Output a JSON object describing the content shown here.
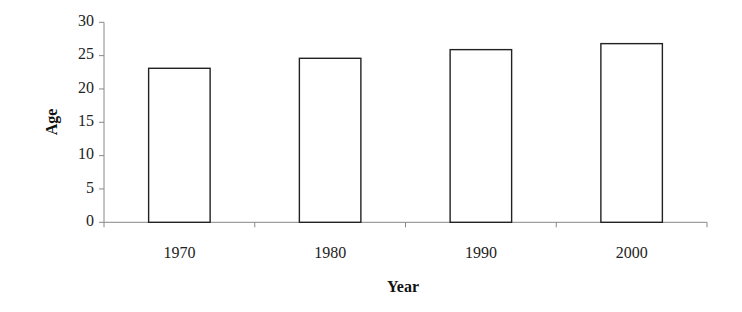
{
  "chart_data": {
    "type": "bar",
    "title": "",
    "xlabel": "Year",
    "ylabel": "Age",
    "categories": [
      "1970",
      "1980",
      "1990",
      "2000"
    ],
    "values": [
      23.1,
      24.6,
      25.9,
      26.8
    ],
    "ylim": [
      0,
      30
    ],
    "yticks": [
      "0",
      "5",
      "10",
      "15",
      "20",
      "25",
      "30"
    ],
    "grid": false,
    "legend": null,
    "bar_fill": "#ffffff",
    "bar_stroke": "#222222",
    "axis_color": "#888888"
  }
}
